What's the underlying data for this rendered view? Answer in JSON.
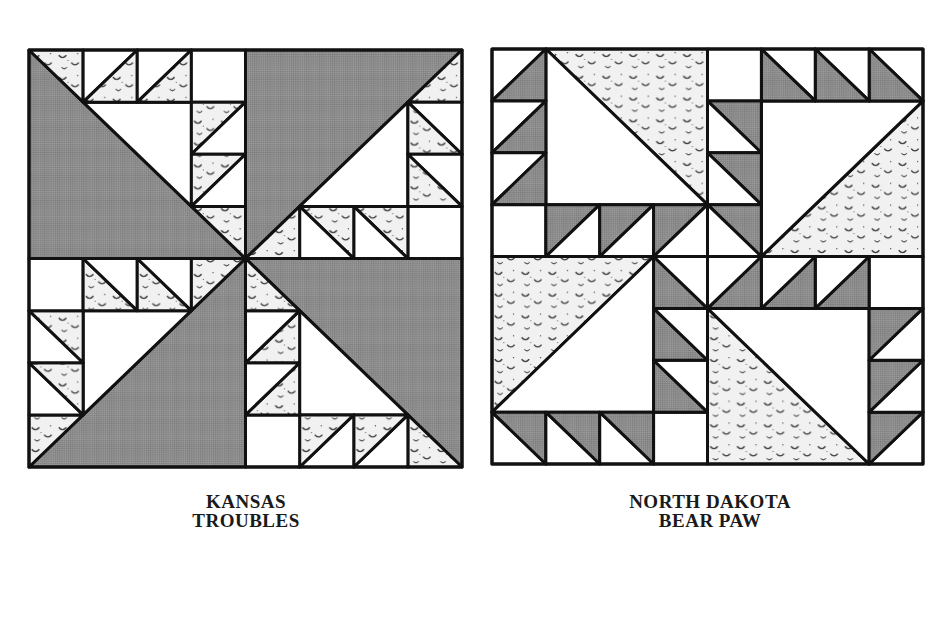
{
  "colors": {
    "background": "#ffffff",
    "line": "#111111",
    "dark_fill": "#8c8c8c",
    "print_fill": "#f1f1f1",
    "print_mark": "#3a3a3a",
    "white_fill": "#ffffff"
  },
  "blocks": [
    {
      "id": "kansas-troubles",
      "caption_line1": "KANSAS",
      "caption_line2": "TROUBLES",
      "x": 29,
      "y": 50,
      "size": 433,
      "pattern": "kansas"
    },
    {
      "id": "north-dakota-bear-paw",
      "caption_line1": "NORTH DAKOTA",
      "caption_line2": "BEAR PAW",
      "x": 492,
      "y": 49,
      "size": 431,
      "pattern": "bearpaw"
    }
  ],
  "captions": {
    "kansas": {
      "line1": "KANSAS",
      "line2": "TROUBLES"
    },
    "bearpaw": {
      "line1": "NORTH DAKOTA",
      "line2": "BEAR PAW"
    }
  }
}
